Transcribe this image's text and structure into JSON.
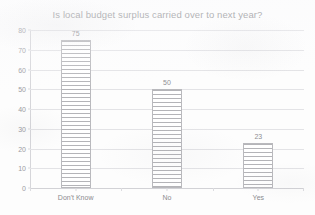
{
  "chart_data": {
    "type": "bar",
    "title": "Is local budget surplus carried over to next year?",
    "xlabel": "",
    "ylabel": "",
    "categories": [
      "Don't Know",
      "No",
      "Yes"
    ],
    "values": [
      75,
      50,
      23
    ],
    "value_labels": [
      "75",
      "50",
      "23"
    ],
    "ylim": [
      0,
      80
    ],
    "ytick_labels": [
      "80",
      "70",
      "60",
      "50",
      "40",
      "30",
      "20",
      "10",
      "0"
    ],
    "ytick_values": [
      80,
      70,
      60,
      50,
      40,
      30,
      20,
      10,
      0
    ],
    "grid": "horizontal",
    "legend": "none",
    "series": [
      {
        "name": "Responses",
        "values": [
          75,
          50,
          23
        ]
      }
    ]
  },
  "style": {
    "bar_fill": "#ffffff",
    "bar_hatch_color": "#b4b4b8",
    "bar_border": "#b9b9bd",
    "gridline_color": "#e3e3e6",
    "title_color": "#8e8e92",
    "tick_label_color": "#9b9b9f",
    "background": "#fdfdfd"
  }
}
